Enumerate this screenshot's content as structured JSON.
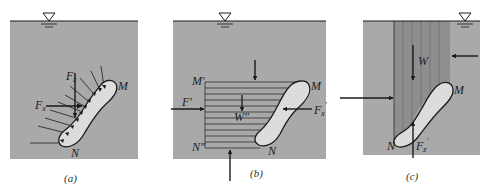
{
  "colors": {
    "water": "#a9a9a9",
    "shaded_column": "#8e8e8e",
    "body_fill": "#dcdcdc",
    "line": "#1a1a1a",
    "background": "#ffffff"
  },
  "panels": [
    {
      "id": "a",
      "caption": "(a)",
      "labels": {
        "Fz": "F",
        "Fz_sub": "z",
        "Fx": "F",
        "Fx_sub": "x",
        "M": "M",
        "N": "N"
      }
    },
    {
      "id": "b",
      "caption": "(b)",
      "labels": {
        "M_prime": "M′",
        "N_prime": "N″",
        "F_prime": "F′",
        "W_prime": "W″",
        "Fx_prime": "F",
        "Fx_prime_sub": "x",
        "Fx_prime_sup": "′",
        "M": "M",
        "N": "N"
      }
    },
    {
      "id": "c",
      "caption": "(c)",
      "labels": {
        "W": "W",
        "Fz_prime": "F",
        "Fz_prime_sub": "z",
        "Fz_prime_sup": "′",
        "M": "M",
        "N": "N"
      }
    }
  ],
  "free_surface_symbol": "▽"
}
